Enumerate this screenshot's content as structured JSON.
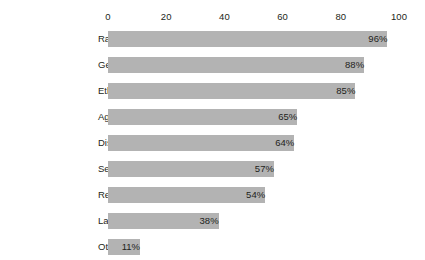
{
  "chart_data": {
    "type": "bar",
    "orientation": "horizontal",
    "title": "",
    "subtitle": "",
    "xlabel": "",
    "ylabel": "",
    "xlim": [
      0,
      100
    ],
    "grid": false,
    "legend": "none",
    "axis_position": "top",
    "tick_labels": [
      "0",
      "20",
      "40",
      "60",
      "80",
      "100"
    ],
    "ticks": [
      0,
      20,
      40,
      60,
      80,
      100
    ],
    "categories": [
      "Race",
      "Gender",
      "Ethnicity",
      "Age",
      "Disability",
      "Sexual Orientation",
      "Religion",
      "Language",
      "Other"
    ],
    "values": [
      96,
      88,
      85,
      65,
      64,
      57,
      54,
      38,
      11
    ],
    "value_labels": [
      "96%",
      "88%",
      "85%",
      "65%",
      "64%",
      "57%",
      "54%",
      "38%",
      "11%"
    ],
    "bar_color": "#b3b3b3",
    "text_color": "#231f20",
    "background_color": "#ffffff"
  }
}
